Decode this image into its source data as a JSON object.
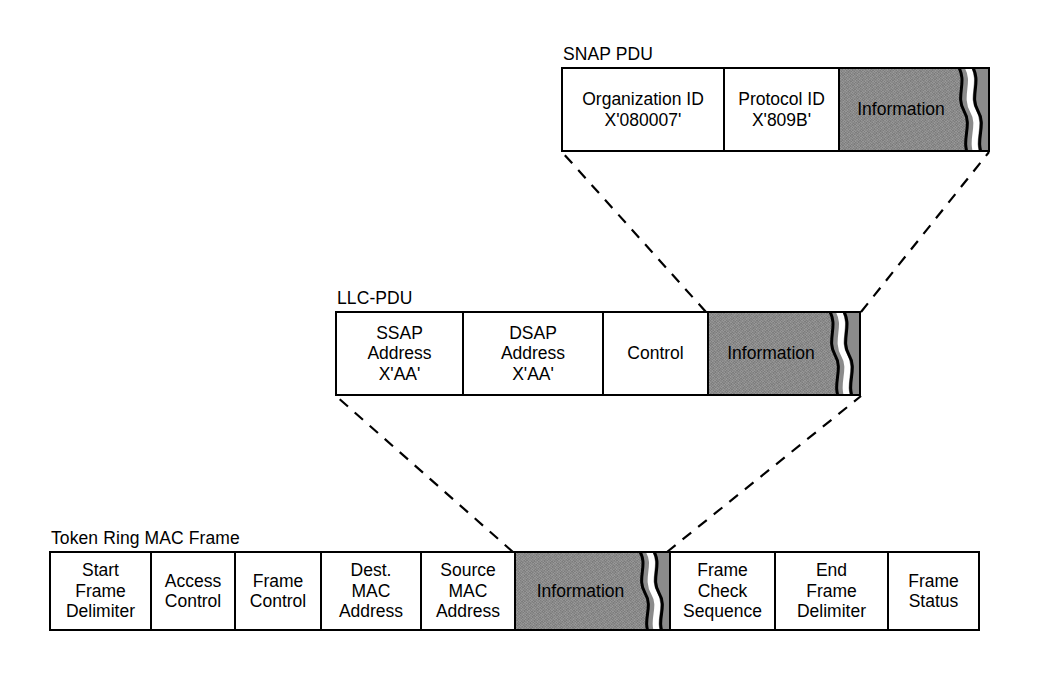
{
  "diagram": {
    "colors": {
      "outline": "#000000",
      "payload_fill": "#8b8b8b",
      "background": "#ffffff",
      "connector": "#000000"
    }
  },
  "pdus": {
    "snap": {
      "caption": "SNAP PDU",
      "fields": [
        {
          "name": "organization-id",
          "lines": [
            "Organization ID",
            "X'080007'"
          ]
        },
        {
          "name": "protocol-id",
          "lines": [
            "Protocol ID",
            "X'809B'"
          ]
        },
        {
          "name": "information",
          "lines": [
            "Information"
          ],
          "payload": true
        }
      ]
    },
    "llc": {
      "caption": "LLC-PDU",
      "fields": [
        {
          "name": "ssap-address",
          "lines": [
            "SSAP",
            "Address",
            "X'AA'"
          ]
        },
        {
          "name": "dsap-address",
          "lines": [
            "DSAP",
            "Address",
            "X'AA'"
          ]
        },
        {
          "name": "control",
          "lines": [
            "Control"
          ]
        },
        {
          "name": "information",
          "lines": [
            "Information"
          ],
          "payload": true
        }
      ]
    },
    "mac": {
      "caption": "Token Ring MAC Frame",
      "fields": [
        {
          "name": "start-frame-delimiter",
          "lines": [
            "Start",
            "Frame",
            "Delimiter"
          ]
        },
        {
          "name": "access-control",
          "lines": [
            "Access",
            "Control"
          ]
        },
        {
          "name": "frame-control",
          "lines": [
            "Frame",
            "Control"
          ]
        },
        {
          "name": "dest-mac-address",
          "lines": [
            "Dest.",
            "MAC",
            "Address"
          ]
        },
        {
          "name": "source-mac-address",
          "lines": [
            "Source",
            "MAC",
            "Address"
          ]
        },
        {
          "name": "information",
          "lines": [
            "Information"
          ],
          "payload": true
        },
        {
          "name": "frame-check-sequence",
          "lines": [
            "Frame",
            "Check",
            "Sequence"
          ]
        },
        {
          "name": "end-frame-delimiter",
          "lines": [
            "End",
            "Frame",
            "Delimiter"
          ]
        },
        {
          "name": "frame-status",
          "lines": [
            "Frame",
            "Status"
          ]
        }
      ]
    }
  }
}
